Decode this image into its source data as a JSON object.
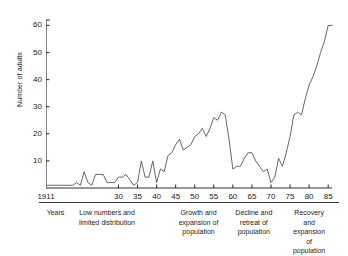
{
  "chart_data": {
    "type": "line",
    "title": "",
    "xlabel": "",
    "ylabel": "Number of adults",
    "xlim": [
      1911,
      1986
    ],
    "ylim": [
      0,
      62
    ],
    "grid": false,
    "legend": null,
    "x_tick_labels": [
      "1911",
      "30",
      "35",
      "40",
      "45",
      "50",
      "55",
      "60",
      "65",
      "70",
      "75",
      "80",
      "85"
    ],
    "x_tick_values": [
      1911,
      1930,
      1935,
      1940,
      1945,
      1950,
      1955,
      1960,
      1965,
      1970,
      1975,
      1980,
      1985
    ],
    "y_tick_labels": [
      "10",
      "20",
      "30",
      "40",
      "50",
      "60"
    ],
    "y_tick_values": [
      10,
      20,
      30,
      40,
      50,
      60
    ],
    "series": [
      {
        "name": "Number of adults",
        "x": [
          1911,
          1912,
          1913,
          1914,
          1915,
          1916,
          1917,
          1918,
          1919,
          1920,
          1921,
          1922,
          1923,
          1924,
          1925,
          1926,
          1927,
          1928,
          1929,
          1930,
          1931,
          1932,
          1933,
          1934,
          1935,
          1936,
          1937,
          1938,
          1939,
          1940,
          1941,
          1942,
          1943,
          1944,
          1945,
          1946,
          1947,
          1948,
          1949,
          1950,
          1951,
          1952,
          1953,
          1954,
          1955,
          1956,
          1957,
          1958,
          1959,
          1960,
          1961,
          1962,
          1963,
          1964,
          1965,
          1966,
          1967,
          1968,
          1969,
          1970,
          1971,
          1972,
          1973,
          1974,
          1975,
          1976,
          1977,
          1978,
          1979,
          1980,
          1981,
          1982,
          1983,
          1984,
          1985,
          1986
        ],
        "y": [
          1,
          1,
          1,
          1,
          1,
          1,
          1,
          1,
          2,
          1,
          6,
          2,
          1,
          5,
          5,
          5,
          2,
          2,
          2,
          4,
          4,
          5,
          3,
          1,
          2,
          10,
          4,
          4,
          10,
          2,
          7,
          6,
          12,
          13,
          16,
          18,
          14,
          15,
          16,
          19,
          20,
          22,
          19,
          22,
          26,
          25,
          28,
          27,
          18,
          7,
          8,
          8,
          11,
          13,
          13,
          10,
          8,
          6,
          7,
          2,
          4,
          11,
          8,
          13,
          19,
          27,
          28,
          27,
          33,
          38,
          41,
          45,
          50,
          54,
          60,
          60
        ]
      }
    ],
    "annotations": [
      {
        "label_lines": [
          "Years"
        ],
        "center_year": 1913.5
      },
      {
        "label_lines": [
          "Low numbers and",
          "limited distribution"
        ],
        "start_year": 1911,
        "end_year": 1943,
        "center_year": 1927
      },
      {
        "label_lines": [
          "Growth and",
          "expansion of",
          "population"
        ],
        "start_year": 1944,
        "end_year": 1958,
        "center_year": 1951
      },
      {
        "label_lines": [
          "Decline and",
          "retreat of",
          "population"
        ],
        "start_year": 1959,
        "end_year": 1972,
        "center_year": 1965.5
      },
      {
        "label_lines": [
          "Recovery and",
          "expansion of",
          "population"
        ],
        "start_year": 1973,
        "end_year": 1986,
        "center_year": 1980
      }
    ],
    "line_color": "#555555",
    "axis_color": "#333333"
  },
  "colors": {
    "background": "#ffffff",
    "line": "#555555",
    "axis": "#333333",
    "text": "#1a1a1a"
  }
}
